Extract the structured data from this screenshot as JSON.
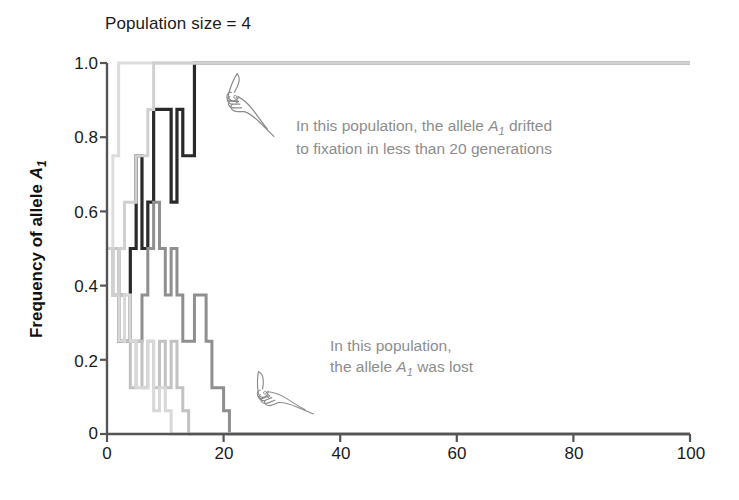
{
  "chart_data": {
    "type": "line",
    "title": "Population size = 4",
    "xlabel": "",
    "ylabel": "Frequency of allele A1",
    "xlim": [
      0,
      100
    ],
    "ylim": [
      0,
      1.0
    ],
    "grid": false,
    "legend": "none",
    "x_ticks": [
      "0",
      "20",
      "40",
      "60",
      "80",
      "100"
    ],
    "x_tick_values": [
      0,
      20,
      40,
      60,
      80,
      100
    ],
    "y_ticks": [
      "0",
      "0.2",
      "0.4",
      "0.6",
      "0.8",
      "1.0"
    ],
    "y_tick_values": [
      0,
      0.2,
      0.4,
      0.6,
      0.8,
      1.0
    ],
    "series": [
      {
        "name": "population-1-fixed-dark",
        "color": "#2a2a2a",
        "width": 3.2,
        "x": [
          0,
          1,
          2,
          3,
          4,
          5,
          6,
          7,
          8,
          9,
          10,
          11,
          12,
          13,
          14,
          15,
          16,
          17,
          100
        ],
        "values": [
          0.5,
          0.5,
          0.25,
          0.25,
          0.5,
          0.75,
          0.5,
          0.625,
          0.875,
          0.875,
          0.875,
          0.625,
          0.875,
          0.75,
          0.75,
          1.0,
          1.0,
          1.0,
          1.0
        ]
      },
      {
        "name": "population-2-lost-midgray",
        "color": "#8f8f8f",
        "width": 3.0,
        "x": [
          0,
          1,
          2,
          3,
          4,
          5,
          6,
          7,
          8,
          9,
          10,
          11,
          12,
          13,
          14,
          15,
          16,
          17,
          18,
          19,
          20,
          21,
          100
        ],
        "values": [
          0.5,
          0.375,
          0.375,
          0.25,
          0.25,
          0.25,
          0.375,
          0.5,
          0.625,
          0.5,
          0.375,
          0.5,
          0.375,
          0.25,
          0.25,
          0.375,
          0.375,
          0.25,
          0.125,
          0.125,
          0.0625,
          0.0,
          0.0
        ]
      },
      {
        "name": "population-3-lost-lightgray",
        "color": "#c2c2c2",
        "width": 3.0,
        "x": [
          0,
          1,
          2,
          3,
          4,
          5,
          6,
          7,
          8,
          9,
          10,
          11,
          12,
          13,
          14,
          100
        ],
        "values": [
          0.5,
          0.5,
          0.375,
          0.25,
          0.125,
          0.25,
          0.125,
          0.25,
          0.125,
          0.25,
          0.125,
          0.25,
          0.125,
          0.0625,
          0.0,
          0.0
        ]
      },
      {
        "name": "population-4-lost-palegray",
        "color": "#d8d8d8",
        "width": 3.0,
        "x": [
          0,
          1,
          2,
          3,
          4,
          5,
          6,
          7,
          8,
          9,
          10,
          11,
          12,
          100
        ],
        "values": [
          0.5,
          0.375,
          0.25,
          0.375,
          0.25,
          0.125,
          0.125,
          0.25,
          0.0625,
          0.125,
          0.0625,
          0.0,
          0.0,
          0.0
        ]
      },
      {
        "name": "population-5-fixed-palegray",
        "color": "#dcdcdc",
        "width": 3.0,
        "x": [
          0,
          1,
          2,
          100
        ],
        "values": [
          0.5,
          0.75,
          1.0,
          1.0
        ]
      },
      {
        "name": "population-6-fixed-lightgray",
        "color": "#d0d0d0",
        "width": 3.0,
        "x": [
          0,
          1,
          2,
          3,
          4,
          5,
          6,
          7,
          8,
          100
        ],
        "values": [
          0.5,
          0.375,
          0.5,
          0.625,
          0.625,
          0.75,
          0.75,
          0.875,
          1.0,
          1.0
        ]
      }
    ],
    "annotations": [
      {
        "id": "annot-fixation",
        "line1_prefix": "In this population, the allele ",
        "line1_italic": "A",
        "line1_sub": "1",
        "line1_suffix": " drifted",
        "line2": "to fixation in less than 20 generations",
        "pointer": "hand-pointing-icon"
      },
      {
        "id": "annot-lost",
        "line1": "In this population,",
        "line2_prefix": "the allele ",
        "line2_italic": "A",
        "line2_sub": "1",
        "line2_suffix": " was lost",
        "pointer": "hand-pointing-icon"
      }
    ]
  },
  "axis": {
    "title": "Population size = 4",
    "y_title_prefix": "Frequency of allele ",
    "y_title_italic": "A",
    "y_title_sub": "1",
    "x_tick_0": "0",
    "x_tick_1": "20",
    "x_tick_2": "40",
    "x_tick_3": "60",
    "x_tick_4": "80",
    "x_tick_5": "100",
    "y_tick_0": "0",
    "y_tick_1": "0.2",
    "y_tick_2": "0.4",
    "y_tick_3": "0.6",
    "y_tick_4": "0.8",
    "y_tick_5": "1.0"
  },
  "colors": {
    "axis": "#555555",
    "text": "#1a1a1a",
    "annotation_text": "#8d8d8d",
    "background": "#ffffff"
  },
  "annotations_text": {
    "fixation_line1_a": "In this population, the allele ",
    "fixation_line1_italic": "A",
    "fixation_line1_sub": "1",
    "fixation_line1_b": " drifted",
    "fixation_line2": "to fixation in less than 20 generations",
    "lost_line1": "In this population,",
    "lost_line2_a": "the allele ",
    "lost_line2_italic": "A",
    "lost_line2_sub": "1",
    "lost_line2_b": " was lost"
  }
}
